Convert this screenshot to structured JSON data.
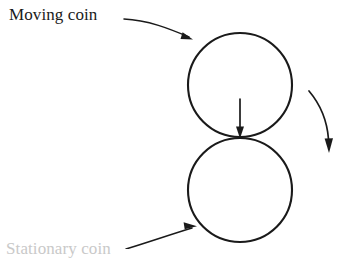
{
  "figure": {
    "type": "physics-diagram",
    "background_color": "#ffffff",
    "stroke_color": "#1a1a1a",
    "width": 339,
    "height": 249
  },
  "labels": {
    "moving_coin": "Moving coin",
    "stationary_coin": "Stationary coin"
  },
  "shapes": {
    "moving_coin_circle": {
      "name": "moving-coin",
      "cx": 240,
      "cy": 85,
      "r": 52
    },
    "stationary_coin_circle": {
      "name": "stationary-coin",
      "cx": 240,
      "cy": 190,
      "r": 52
    }
  },
  "annotations": {
    "moving_coin_leader": {
      "name": "moving-coin-leader-arrow",
      "from_x": 124,
      "from_y": 19,
      "to_x": 192,
      "to_y": 39
    },
    "stationary_coin_leader": {
      "name": "stationary-coin-leader-arrow",
      "from_x": 128,
      "from_y": 249,
      "to_x": 196,
      "to_y": 226
    },
    "impact_force_arrow": {
      "name": "impact-force-arrow",
      "from_x": 240,
      "from_y": 99,
      "to_x": 240,
      "to_y": 137,
      "direction": "down"
    },
    "rotation_arrow": {
      "name": "rotation-direction-arrow",
      "from_x": 309,
      "from_y": 91,
      "to_x": 329,
      "to_y": 152,
      "direction": "down-curving"
    }
  },
  "chart_data": {
    "type": "diagram",
    "elements": [
      {
        "id": "moving-coin",
        "shape": "circle",
        "cx": 240,
        "cy": 85,
        "r": 52,
        "label": "Moving coin"
      },
      {
        "id": "stationary-coin",
        "shape": "circle",
        "cx": 240,
        "cy": 190,
        "r": 52,
        "label": "Stationary coin"
      },
      {
        "id": "contact-point",
        "shape": "point",
        "x": 240,
        "y": 138
      },
      {
        "id": "impact-force",
        "shape": "arrow",
        "x1": 240,
        "y1": 99,
        "x2": 240,
        "y2": 137
      },
      {
        "id": "rotation-indicator",
        "shape": "curved-arrow",
        "x1": 309,
        "y1": 91,
        "x2": 329,
        "y2": 152
      }
    ]
  }
}
